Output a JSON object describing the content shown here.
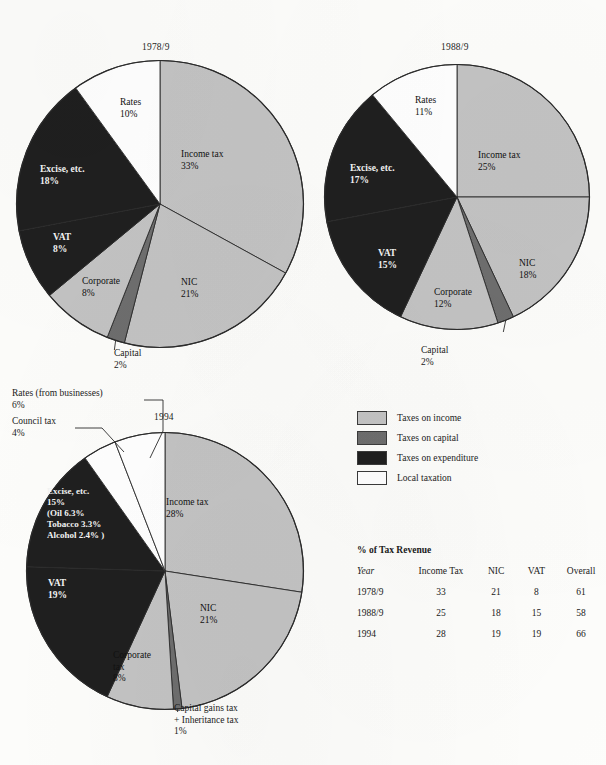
{
  "colors": {
    "income": "#c3c3c3",
    "capital": "#6e6e6e",
    "expenditure": "#1f1f1f",
    "local": "#ffffff",
    "outline": "#2b2b2b",
    "page_bg": "#fdfdfb"
  },
  "chart_data": [
    {
      "type": "pie",
      "title": "1978/9",
      "slices": [
        {
          "label": "Income tax",
          "percent": 33,
          "value_text": "33%",
          "category": "income"
        },
        {
          "label": "NIC",
          "percent": 21,
          "value_text": "21%",
          "category": "income"
        },
        {
          "label": "Capital",
          "percent": 2,
          "value_text": "2%",
          "category": "capital"
        },
        {
          "label": "Corporate",
          "percent": 8,
          "value_text": "8%",
          "category": "income"
        },
        {
          "label": "VAT",
          "percent": 8,
          "value_text": "8%",
          "category": "expenditure"
        },
        {
          "label": "Excise, etc.",
          "percent": 18,
          "value_text": "18%",
          "category": "expenditure"
        },
        {
          "label": "Rates",
          "percent": 10,
          "value_text": "10%",
          "category": "local"
        }
      ]
    },
    {
      "type": "pie",
      "title": "1988/9",
      "slices": [
        {
          "label": "Income tax",
          "percent": 25,
          "value_text": "25%",
          "category": "income"
        },
        {
          "label": "NIC",
          "percent": 18,
          "value_text": "18%",
          "category": "income"
        },
        {
          "label": "Capital",
          "percent": 2,
          "value_text": "2%",
          "category": "capital"
        },
        {
          "label": "Corporate",
          "percent": 12,
          "value_text": "12%",
          "category": "income"
        },
        {
          "label": "VAT",
          "percent": 15,
          "value_text": "15%",
          "category": "expenditure"
        },
        {
          "label": "Excise, etc.",
          "percent": 17,
          "value_text": "17%",
          "category": "expenditure"
        },
        {
          "label": "Rates",
          "percent": 11,
          "value_text": "11%",
          "category": "local"
        }
      ]
    },
    {
      "type": "pie",
      "title": "1994",
      "slices": [
        {
          "label": "Income tax",
          "percent": 28,
          "value_text": "28%",
          "category": "income"
        },
        {
          "label": "NIC",
          "percent": 21,
          "value_text": "21%",
          "category": "income"
        },
        {
          "label": "Capital gains tax + Inheritance tax",
          "percent": 1,
          "value_text": "1%",
          "category": "capital"
        },
        {
          "label": "Corporate tax",
          "percent": 8,
          "value_text": "8%",
          "category": "income"
        },
        {
          "label": "VAT",
          "percent": 19,
          "value_text": "19%",
          "category": "expenditure"
        },
        {
          "label": "Excise, etc.",
          "percent": 15,
          "value_text": "15%",
          "category": "expenditure",
          "detail": [
            "(Oil 6.3%",
            "Tobacco 3.3%",
            "Alcohol 2.4% )"
          ]
        },
        {
          "label": "Council tax",
          "percent": 4,
          "value_text": "4%",
          "category": "local"
        },
        {
          "label": "Rates (from businesses)",
          "percent": 6,
          "value_text": "6%",
          "category": "local"
        }
      ]
    }
  ],
  "pie1": {
    "title": "1978/9",
    "income_tax_label": "Income tax",
    "income_tax_pct": "33%",
    "nic_label": "NIC",
    "nic_pct": "21%",
    "capital_label": "Capital",
    "capital_pct": "2%",
    "corporate_label": "Corporate",
    "corporate_pct": "8%",
    "vat_label": "VAT",
    "vat_pct": "8%",
    "excise_label": "Excise, etc.",
    "excise_pct": "18%",
    "rates_label": "Rates",
    "rates_pct": "10%"
  },
  "pie2": {
    "title": "1988/9",
    "income_tax_label": "Income tax",
    "income_tax_pct": "25%",
    "nic_label": "NIC",
    "nic_pct": "18%",
    "capital_label": "Capital",
    "capital_pct": "2%",
    "corporate_label": "Corporate",
    "corporate_pct": "12%",
    "vat_label": "VAT",
    "vat_pct": "15%",
    "excise_label": "Excise, etc.",
    "excise_pct": "17%",
    "rates_label": "Rates",
    "rates_pct": "11%"
  },
  "pie3": {
    "title": "1994",
    "income_tax_label": "Income tax",
    "income_tax_pct": "28%",
    "nic_label": "NIC",
    "nic_pct": "21%",
    "cgt_line1": "Capital gains tax",
    "cgt_line2": "+ Inheritance tax",
    "cgt_pct": "1%",
    "corporate_line1": "Corporate",
    "corporate_line2": "tax",
    "corporate_pct": "8%",
    "vat_label": "VAT",
    "vat_pct": "19%",
    "excise_label": "Excise, etc.",
    "excise_pct": "15%",
    "excise_d1": "(Oil 6.3%",
    "excise_d2": "Tobacco 3.3%",
    "excise_d3": "Alcohol 2.4% )",
    "council_label": "Council tax",
    "council_pct": "4%",
    "rates_label": "Rates (from businesses)",
    "rates_pct": "6%"
  },
  "legend": {
    "items": [
      {
        "label": "Taxes on income",
        "color": "#c3c3c3"
      },
      {
        "label": "Taxes on capital",
        "color": "#6e6e6e"
      },
      {
        "label": "Taxes on expenditure",
        "color": "#1f1f1f"
      },
      {
        "label": "Local taxation",
        "color": "#ffffff"
      }
    ]
  },
  "table": {
    "title": "% of Tax Revenue",
    "headers": {
      "year": "Year",
      "income_tax": "Income Tax",
      "nic": "NIC",
      "vat": "VAT",
      "overall": "Overall"
    },
    "rows": [
      {
        "year": "1978/9",
        "income_tax": "33",
        "nic": "21",
        "vat": "8",
        "overall": "61"
      },
      {
        "year": "1988/9",
        "income_tax": "25",
        "nic": "18",
        "vat": "15",
        "overall": "58"
      },
      {
        "year": "1994",
        "income_tax": "28",
        "nic": "19",
        "vat": "19",
        "overall": "66"
      }
    ]
  }
}
